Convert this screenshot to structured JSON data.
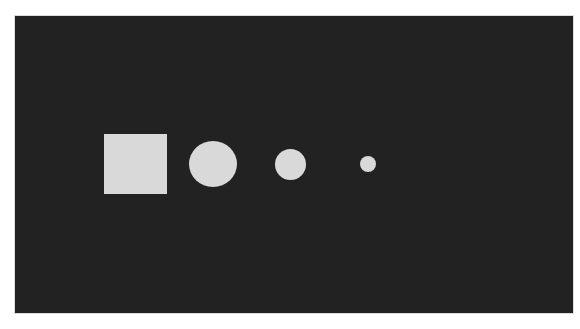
{
  "canvas": {
    "background_color": "#222222",
    "border_color": "#dcdcdc"
  },
  "shapes": [
    {
      "type": "square",
      "size": "large",
      "color": "#d9d9d9"
    },
    {
      "type": "circle",
      "size": "large",
      "color": "#d9d9d9"
    },
    {
      "type": "circle",
      "size": "medium",
      "color": "#d9d9d9"
    },
    {
      "type": "circle",
      "size": "small",
      "color": "#d9d9d9"
    }
  ]
}
